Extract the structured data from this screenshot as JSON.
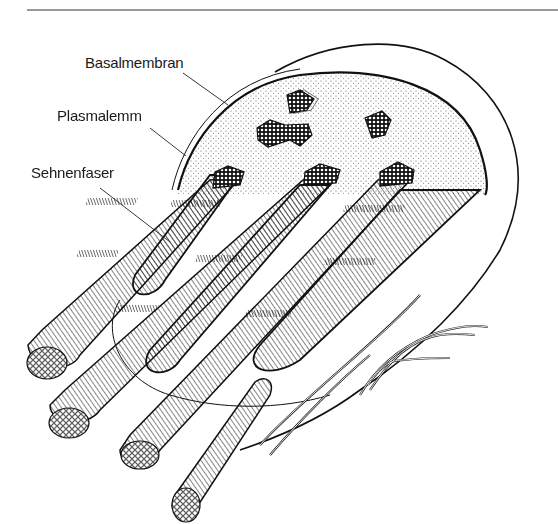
{
  "figure": {
    "type": "anatomical line illustration",
    "labels": [
      {
        "id": "basalmembran",
        "text": "Basalmembran",
        "x": 85,
        "y": 55
      },
      {
        "id": "plasmalemm",
        "text": "Plasmalemm",
        "x": 57,
        "y": 108
      },
      {
        "id": "sehnenfaser",
        "text": "Sehnenfaser",
        "x": 31,
        "y": 165
      }
    ],
    "colors": {
      "ink": "#1a1a1a",
      "stipple": "#555555",
      "background": "#ffffff"
    }
  }
}
